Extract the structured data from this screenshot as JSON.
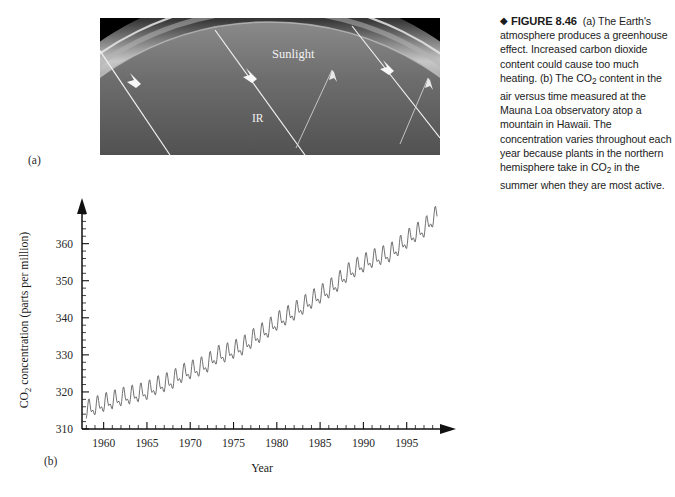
{
  "figure": {
    "caption_marker": "◆",
    "caption_title": "FIGURE 8.46",
    "caption_body": "(a) The Earth's atmosphere produces a greenhouse effect. Increased carbon dioxide content could cause too much heating. (b) The CO2 content in the air versus time measured at the Mauna Loa observatory atop a mountain in Hawaii. The concentration varies throughout each year because plants in the northern hemisphere take in CO2 in the summer when they are most active.",
    "panel_a_letter": "(a)",
    "panel_b_letter": "(b)"
  },
  "photo": {
    "sunlight_label": "Sunlight",
    "ir_label": "IR",
    "sky_color": "#000000",
    "atmosphere_color": "#c9c9c9",
    "earth_color": "#6f6f6f",
    "ray_color": "#f5f5f5"
  },
  "chart_data": {
    "type": "line",
    "title": "",
    "xlabel": "Year",
    "ylabel": "CO2 concentration (parts per million)",
    "ylabel_prefix": "CO",
    "ylabel_sub": "2",
    "ylabel_suffix": " concentration (parts per million)",
    "xlim": [
      1957.5,
      1998.5
    ],
    "ylim": [
      310,
      368
    ],
    "yticks": [
      310,
      320,
      330,
      340,
      350,
      360
    ],
    "ytick_labels": [
      "310",
      "320",
      "330",
      "340",
      "350",
      "360"
    ],
    "y_minor_interval": 2,
    "xticks": [
      1960,
      1965,
      1970,
      1975,
      1980,
      1985,
      1990,
      1995
    ],
    "xtick_labels": [
      "1960",
      "1965",
      "1970",
      "1975",
      "1980",
      "1985",
      "1990",
      "1995"
    ],
    "x_minor_interval": 1,
    "grid": false,
    "legend": "none",
    "line_color": "#585858",
    "series": [
      {
        "name": "Mauna Loa monthly mean CO2",
        "description": "Monthly mean CO2 concentration showing rising trend with annual seasonal oscillation",
        "annual_trend": [
          {
            "year": 1958,
            "mean": 315.0
          },
          {
            "year": 1959,
            "mean": 315.9
          },
          {
            "year": 1960,
            "mean": 316.8
          },
          {
            "year": 1961,
            "mean": 317.5
          },
          {
            "year": 1962,
            "mean": 318.3
          },
          {
            "year": 1963,
            "mean": 318.8
          },
          {
            "year": 1964,
            "mean": 319.4
          },
          {
            "year": 1965,
            "mean": 320.0
          },
          {
            "year": 1966,
            "mean": 321.3
          },
          {
            "year": 1967,
            "mean": 322.1
          },
          {
            "year": 1968,
            "mean": 323.0
          },
          {
            "year": 1969,
            "mean": 324.6
          },
          {
            "year": 1970,
            "mean": 325.6
          },
          {
            "year": 1971,
            "mean": 326.3
          },
          {
            "year": 1972,
            "mean": 327.4
          },
          {
            "year": 1973,
            "mean": 329.6
          },
          {
            "year": 1974,
            "mean": 330.1
          },
          {
            "year": 1975,
            "mean": 331.1
          },
          {
            "year": 1976,
            "mean": 332.0
          },
          {
            "year": 1977,
            "mean": 333.8
          },
          {
            "year": 1978,
            "mean": 335.4
          },
          {
            "year": 1979,
            "mean": 336.8
          },
          {
            "year": 1980,
            "mean": 338.7
          },
          {
            "year": 1981,
            "mean": 340.1
          },
          {
            "year": 1982,
            "mean": 341.4
          },
          {
            "year": 1983,
            "mean": 343.0
          },
          {
            "year": 1984,
            "mean": 344.6
          },
          {
            "year": 1985,
            "mean": 346.0
          },
          {
            "year": 1986,
            "mean": 347.4
          },
          {
            "year": 1987,
            "mean": 349.2
          },
          {
            "year": 1988,
            "mean": 351.6
          },
          {
            "year": 1989,
            "mean": 353.1
          },
          {
            "year": 1990,
            "mean": 354.4
          },
          {
            "year": 1991,
            "mean": 355.6
          },
          {
            "year": 1992,
            "mean": 356.4
          },
          {
            "year": 1993,
            "mean": 357.1
          },
          {
            "year": 1994,
            "mean": 358.8
          },
          {
            "year": 1995,
            "mean": 360.8
          },
          {
            "year": 1996,
            "mean": 362.6
          },
          {
            "year": 1997,
            "mean": 363.8
          },
          {
            "year": 1998,
            "mean": 366.6
          }
        ],
        "seasonal_amplitude": 3.1,
        "seasonal_peak_month": 5,
        "seasonal_trough_month": 9
      }
    ]
  }
}
